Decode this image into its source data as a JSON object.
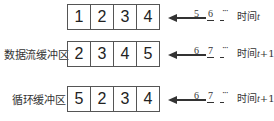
{
  "diagram": {
    "title": "",
    "rows": [
      {
        "label": "",
        "cells": [
          "1",
          "2",
          "3",
          "4"
        ],
        "incoming": [
          "5",
          "6"
        ],
        "ellipsis": "···",
        "time_prefix": "时间",
        "time_var": "t",
        "time_suffix": ""
      },
      {
        "label": "数据流缓冲区",
        "cells": [
          "2",
          "3",
          "4",
          "5"
        ],
        "incoming": [
          "6",
          "7"
        ],
        "ellipsis": "···",
        "time_prefix": "时间",
        "time_var": "t",
        "time_suffix": "+1"
      },
      {
        "label": "循环缓冲区",
        "cells": [
          "5",
          "2",
          "3",
          "4"
        ],
        "incoming": [
          "6",
          "7"
        ],
        "ellipsis": "···",
        "time_prefix": "时间",
        "time_var": "t",
        "time_suffix": "+1"
      }
    ],
    "colors": {
      "line": "#555555",
      "text": "#222222",
      "background": "#ffffff"
    }
  }
}
